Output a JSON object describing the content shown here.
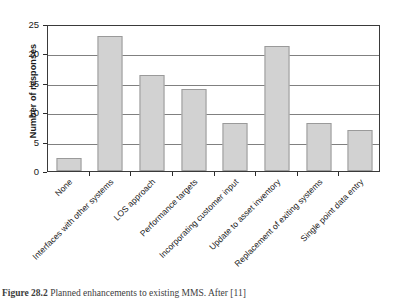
{
  "chart_data": {
    "type": "bar",
    "title": "",
    "xlabel": "",
    "ylabel": "Number of responses",
    "ylim": [
      0,
      25
    ],
    "yticks": [
      0,
      5,
      10,
      15,
      20,
      25
    ],
    "grid": true,
    "legend": "none",
    "categories": [
      "None",
      "Interfaces with other systems",
      "LOS approach",
      "Performance targets",
      "Incorporating customer input",
      "Update to asset inventory",
      "Replacement of exiting systems",
      "Single point data entry"
    ],
    "values": [
      2.2,
      23,
      16.3,
      14,
      8.2,
      21.3,
      8.2,
      7
    ],
    "bar_color": "#d2d2d2",
    "bar_border_color": "#9a9a9a",
    "gridline_color": "#808080",
    "axis_color": "#3a3a3a"
  },
  "caption": {
    "number": "Figure 28.2",
    "text": "Planned enhancements to existing MMS. After [11]"
  }
}
